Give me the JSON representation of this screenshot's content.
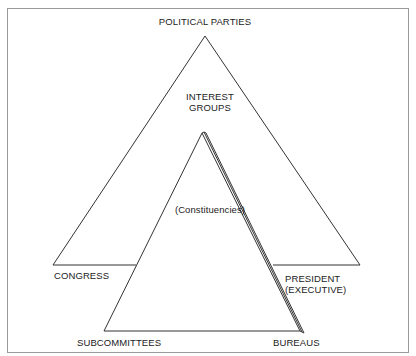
{
  "diagram": {
    "type": "iron-triangle",
    "labels": {
      "political_parties": "POLITICAL PARTIES",
      "interest_groups_line1": "INTEREST",
      "interest_groups_line2": "GROUPS",
      "constituencies": "(Constituencies)",
      "congress": "CONGRESS",
      "president_line1": "PRESIDENT",
      "president_line2": "(EXECUTIVE)",
      "subcommittees": "SUBCOMMITTEES",
      "bureaus": "BUREAUS"
    },
    "colors": {
      "line": "#333333",
      "frame": "#9a9a9a",
      "background": "#ffffff",
      "text": "#222222"
    },
    "outer_triangle": {
      "apex": [
        205,
        36
      ],
      "left": [
        53,
        265
      ],
      "right": [
        360,
        265
      ]
    },
    "inner_triangle": {
      "apex": [
        202,
        133
      ],
      "left": [
        104,
        331
      ],
      "right": [
        300,
        331
      ],
      "stack_offsets": 3
    }
  }
}
